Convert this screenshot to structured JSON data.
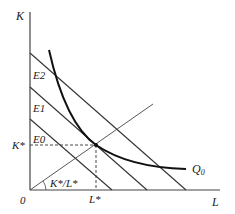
{
  "diagram": {
    "axes": {
      "y_label": "K",
      "x_label": "L",
      "origin_label": "0"
    },
    "isocost_labels": [
      "E2",
      "E1",
      "E0"
    ],
    "isoquant_label": "Q",
    "isoquant_subscript": "0",
    "equilibrium": {
      "k_label": "K*",
      "l_label": "L*"
    },
    "ray_label": "K*/L*",
    "colors": {
      "lines": "#333333",
      "isoquant": "#111111",
      "background": "#ffffff"
    }
  }
}
